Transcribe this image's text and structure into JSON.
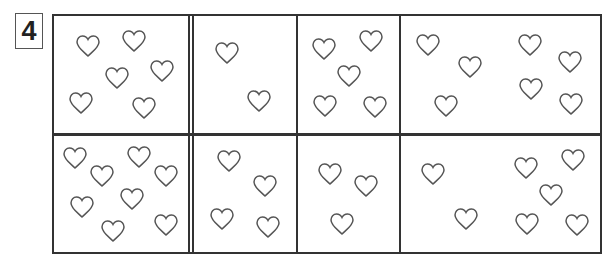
{
  "puzzle_number": "4",
  "heart_color": "#555555",
  "grid": {
    "rows": 2,
    "columns": 5,
    "cells": [
      {
        "row": 0,
        "col": 0,
        "count": 6,
        "hearts": [
          [
            88,
            46
          ],
          [
            134,
            41
          ],
          [
            117,
            78
          ],
          [
            162,
            71
          ],
          [
            81,
            103
          ],
          [
            144,
            108
          ]
        ]
      },
      {
        "row": 0,
        "col": 1,
        "count": 2,
        "hearts": [
          [
            227,
            53
          ],
          [
            259,
            101
          ]
        ]
      },
      {
        "row": 0,
        "col": 2,
        "count": 5,
        "hearts": [
          [
            324,
            49
          ],
          [
            371,
            41
          ],
          [
            349,
            76
          ],
          [
            325,
            106
          ],
          [
            375,
            107
          ]
        ]
      },
      {
        "row": 0,
        "col": 3,
        "count": 3,
        "hearts": [
          [
            428,
            45
          ],
          [
            470,
            67
          ],
          [
            446,
            106
          ]
        ]
      },
      {
        "row": 0,
        "col": 4,
        "count": 4,
        "hearts": [
          [
            530,
            45
          ],
          [
            570,
            62
          ],
          [
            531,
            89
          ],
          [
            571,
            104
          ]
        ]
      },
      {
        "row": 1,
        "col": 0,
        "count": 8,
        "hearts": [
          [
            75,
            158
          ],
          [
            102,
            176
          ],
          [
            139,
            157
          ],
          [
            166,
            176
          ],
          [
            82,
            207
          ],
          [
            132,
            199
          ],
          [
            113,
            231
          ],
          [
            166,
            225
          ]
        ]
      },
      {
        "row": 1,
        "col": 1,
        "count": 4,
        "hearts": [
          [
            229,
            161
          ],
          [
            265,
            186
          ],
          [
            222,
            219
          ],
          [
            268,
            227
          ]
        ]
      },
      {
        "row": 1,
        "col": 2,
        "count": 3,
        "hearts": [
          [
            330,
            174
          ],
          [
            366,
            186
          ],
          [
            342,
            224
          ]
        ]
      },
      {
        "row": 1,
        "col": 3,
        "count": 2,
        "hearts": [
          [
            433,
            174
          ],
          [
            466,
            219
          ]
        ]
      },
      {
        "row": 1,
        "col": 4,
        "count": 5,
        "hearts": [
          [
            526,
            168
          ],
          [
            573,
            160
          ],
          [
            551,
            195
          ],
          [
            527,
            224
          ],
          [
            577,
            225
          ]
        ]
      }
    ]
  }
}
